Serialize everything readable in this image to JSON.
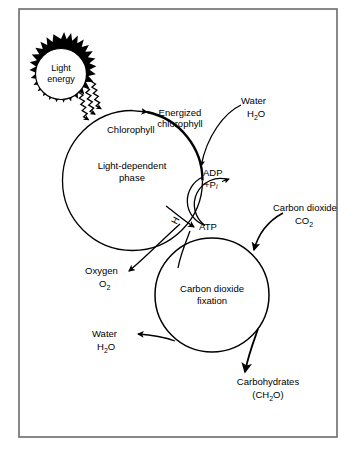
{
  "diagram": {
    "border_color": "#6b6b6b",
    "ink_color": "#000000",
    "background": "#ffffff",
    "nodes": {
      "light_energy": {
        "line1": "Light",
        "line2": "energy",
        "shape": "sunburst"
      },
      "chlorophyll": {
        "label": "Chlorophyll"
      },
      "energized_chlorophyll": {
        "line1": "Energized",
        "line2": "chlorophyll"
      },
      "light_dependent_phase": {
        "line1": "Light-dependent",
        "line2": "phase"
      },
      "adp": {
        "label": "ADP",
        "second_line_prefix": "+P",
        "second_line_subscript": "i"
      },
      "atp": {
        "label": "ATP"
      },
      "hydrogen": {
        "label": "H"
      },
      "water_input": {
        "name": "Water",
        "formula_prefix": "H",
        "formula_sub": "2",
        "formula_suffix": "O"
      },
      "carbon_dioxide_input": {
        "name": "Carbon dioxide",
        "formula_prefix": "CO",
        "formula_sub": "2"
      },
      "carbon_dioxide_fixation": {
        "line1": "Carbon dioxide",
        "line2": "fixation"
      },
      "oxygen_output": {
        "name": "Oxygen",
        "formula_prefix": "O",
        "formula_sub": "2"
      },
      "water_output": {
        "name": "Water",
        "formula_prefix": "H",
        "formula_sub": "2",
        "formula_suffix": "O"
      },
      "carbohydrates_output": {
        "name": "Carbohydrates",
        "formula_prefix": "(CH",
        "formula_sub": "2",
        "formula_suffix": "O)"
      }
    }
  }
}
